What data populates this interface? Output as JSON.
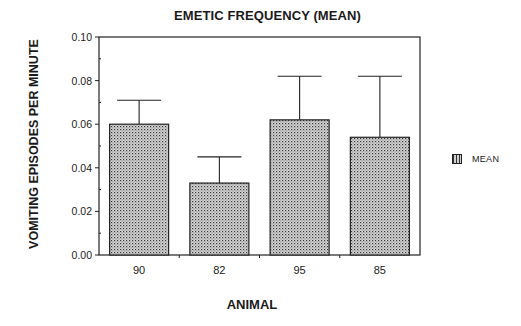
{
  "chart_data": {
    "type": "bar",
    "title": "EMETIC FREQUENCY (MEAN)",
    "xlabel": "ANIMAL",
    "ylabel": "VOMITING EPISODES PER MINUTE",
    "categories": [
      "90",
      "82",
      "95",
      "85"
    ],
    "series": [
      {
        "name": "MEAN",
        "values": [
          0.06,
          0.033,
          0.062,
          0.054
        ],
        "error_upper": [
          0.071,
          0.045,
          0.082,
          0.082
        ]
      }
    ],
    "ylim": [
      0.0,
      0.1
    ],
    "yticks": [
      "0.00",
      "0.02",
      "0.04",
      "0.06",
      "0.08",
      "0.10"
    ],
    "grid": false,
    "legend_position": "right",
    "colors": {
      "bar_fill": "#c8c8c8",
      "bar_dots": "#3a3a3a",
      "axis": "#222222"
    }
  },
  "legend": {
    "label": "MEAN"
  }
}
